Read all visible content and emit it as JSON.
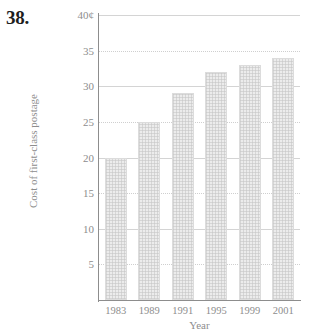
{
  "problem": {
    "number": "38."
  },
  "chart_data": {
    "type": "bar",
    "title": "",
    "xlabel": "Year",
    "ylabel": "Cost of first-class postage",
    "categories": [
      "1983",
      "1989",
      "1991",
      "1995",
      "1999",
      "2001"
    ],
    "values": [
      20,
      25,
      29,
      32,
      33,
      34
    ],
    "value_unit": "¢",
    "ylim": [
      0,
      40
    ],
    "yticks": [
      5,
      10,
      15,
      20,
      25,
      30,
      35,
      40
    ],
    "ytick_labels": [
      "5",
      "10",
      "15",
      "20",
      "25",
      "30",
      "35",
      "40¢"
    ],
    "grid": true,
    "legend": false,
    "colors": {
      "bar_fill": "#ececec",
      "bar_edge": "#dcdcdc",
      "axis": "#8d8d8d",
      "gridline": "#cfcfcf",
      "text": "#8d8d8d",
      "problem_number": "#1e1e1e"
    }
  }
}
